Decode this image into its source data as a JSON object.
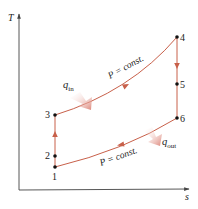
{
  "diagram": {
    "type": "T-s diagram",
    "axes": {
      "y_label": "T",
      "x_label": "s"
    },
    "states": [
      {
        "id": "1",
        "label": "1"
      },
      {
        "id": "2",
        "label": "2"
      },
      {
        "id": "3",
        "label": "3"
      },
      {
        "id": "4",
        "label": "4"
      },
      {
        "id": "5",
        "label": "5"
      },
      {
        "id": "6",
        "label": "6"
      }
    ],
    "process_labels": {
      "upper": "P = const.",
      "lower": "P = const."
    },
    "heat": {
      "in_symbol": "q",
      "in_sub": "in",
      "out_symbol": "q",
      "out_sub": "out"
    },
    "colors": {
      "process_line": "#c8604a",
      "axis": "#444444",
      "point": "#111111",
      "heat_arrow": "#d9786a"
    }
  }
}
